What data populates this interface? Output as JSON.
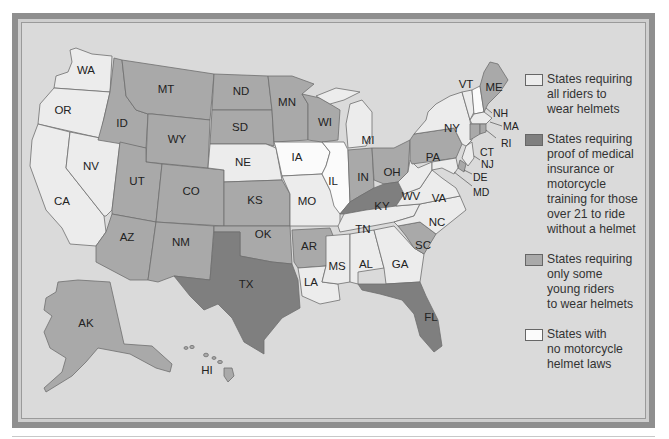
{
  "colors": {
    "all_riders": "#ececec",
    "proof_medical": "#7f7f7f",
    "young_riders": "#a9a9a9",
    "no_law": "#fbfbfb",
    "background": "#dadada",
    "frame": "#8f8f8f"
  },
  "legend": {
    "items": [
      {
        "key": "all_riders",
        "label": "States requiring all riders to wear helmets",
        "lines": [
          "States requiring",
          "all riders to",
          "wear helmets"
        ]
      },
      {
        "key": "proof_medical",
        "label": "States requiring proof of medical insurance or motorcycle training for those over 21 to ride without a helmet",
        "lines": [
          "States requiring",
          "proof of medical",
          "insurance or",
          "motorcycle",
          "training for those",
          "over 21 to ride",
          "without a helmet"
        ]
      },
      {
        "key": "young_riders",
        "label": "States requiring only some young riders to wear helmets",
        "lines": [
          "States requiring",
          "only some",
          "young riders",
          "to wear helmets"
        ]
      },
      {
        "key": "no_law",
        "label": "States with no motorcycle helmet laws",
        "lines": [
          "States with",
          "no motorcycle",
          "helmet laws"
        ]
      }
    ]
  },
  "states": {
    "WA": {
      "label": "WA",
      "category": "all_riders"
    },
    "OR": {
      "label": "OR",
      "category": "all_riders"
    },
    "CA": {
      "label": "CA",
      "category": "all_riders"
    },
    "NV": {
      "label": "NV",
      "category": "all_riders"
    },
    "ID": {
      "label": "ID",
      "category": "young_riders"
    },
    "MT": {
      "label": "MT",
      "category": "young_riders"
    },
    "WY": {
      "label": "WY",
      "category": "young_riders"
    },
    "UT": {
      "label": "UT",
      "category": "young_riders"
    },
    "CO": {
      "label": "CO",
      "category": "young_riders"
    },
    "AZ": {
      "label": "AZ",
      "category": "young_riders"
    },
    "NM": {
      "label": "NM",
      "category": "young_riders"
    },
    "ND": {
      "label": "ND",
      "category": "young_riders"
    },
    "SD": {
      "label": "SD",
      "category": "young_riders"
    },
    "NE": {
      "label": "NE",
      "category": "all_riders"
    },
    "KS": {
      "label": "KS",
      "category": "young_riders"
    },
    "OK": {
      "label": "OK",
      "category": "young_riders"
    },
    "TX": {
      "label": "TX",
      "category": "proof_medical"
    },
    "MN": {
      "label": "MN",
      "category": "young_riders"
    },
    "IA": {
      "label": "IA",
      "category": "no_law"
    },
    "MO": {
      "label": "MO",
      "category": "all_riders"
    },
    "AR": {
      "label": "AR",
      "category": "young_riders"
    },
    "LA": {
      "label": "LA",
      "category": "all_riders"
    },
    "WI": {
      "label": "WI",
      "category": "young_riders"
    },
    "IL": {
      "label": "IL",
      "category": "no_law"
    },
    "MI": {
      "label": "MI",
      "category": "all_riders"
    },
    "IN": {
      "label": "IN",
      "category": "young_riders"
    },
    "OH": {
      "label": "OH",
      "category": "young_riders"
    },
    "KY": {
      "label": "KY",
      "category": "proof_medical"
    },
    "TN": {
      "label": "TN",
      "category": "all_riders"
    },
    "MS": {
      "label": "MS",
      "category": "all_riders"
    },
    "AL": {
      "label": "AL",
      "category": "all_riders"
    },
    "GA": {
      "label": "GA",
      "category": "all_riders"
    },
    "FL": {
      "label": "FL",
      "category": "proof_medical"
    },
    "SC": {
      "label": "SC",
      "category": "young_riders"
    },
    "NC": {
      "label": "NC",
      "category": "all_riders"
    },
    "VA": {
      "label": "VA",
      "category": "all_riders"
    },
    "WV": {
      "label": "WV",
      "category": "all_riders"
    },
    "PA": {
      "label": "PA",
      "category": "young_riders"
    },
    "NY": {
      "label": "NY",
      "category": "all_riders"
    },
    "VT": {
      "label": "VT",
      "category": "all_riders"
    },
    "NH": {
      "label": "NH",
      "category": "no_law"
    },
    "ME": {
      "label": "ME",
      "category": "young_riders"
    },
    "MA": {
      "label": "MA",
      "category": "all_riders"
    },
    "RI": {
      "label": "RI",
      "category": "young_riders"
    },
    "CT": {
      "label": "CT",
      "category": "young_riders"
    },
    "NJ": {
      "label": "NJ",
      "category": "all_riders"
    },
    "DE": {
      "label": "DE",
      "category": "young_riders"
    },
    "MD": {
      "label": "MD",
      "category": "all_riders"
    },
    "AK": {
      "label": "AK",
      "category": "young_riders"
    },
    "HI": {
      "label": "HI",
      "category": "young_riders"
    }
  }
}
